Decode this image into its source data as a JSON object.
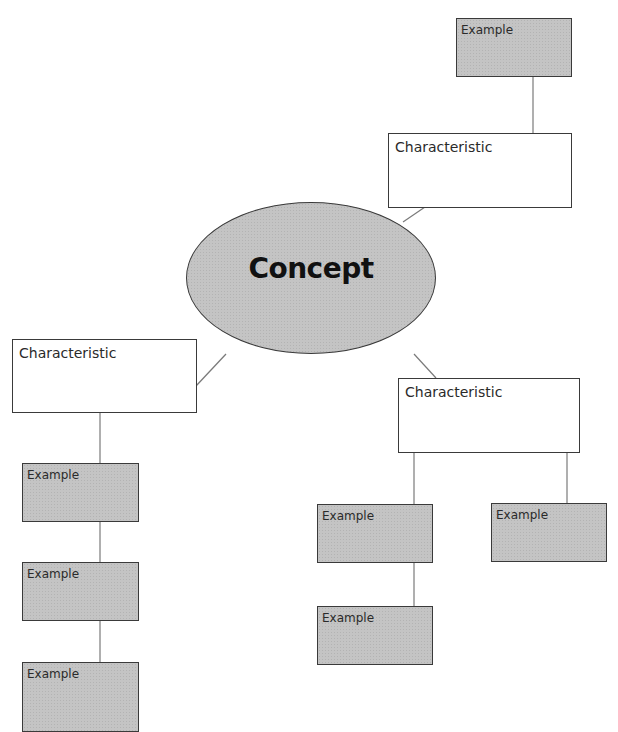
{
  "diagram": {
    "type": "concept-map",
    "center": {
      "label": "Concept"
    },
    "characteristics": [
      {
        "label": "Characteristic",
        "examples": [
          "Example"
        ]
      },
      {
        "label": "Characteristic",
        "examples": [
          "Example",
          "Example",
          "Example"
        ]
      },
      {
        "label": "Characteristic",
        "examples": [
          "Example",
          "Example",
          "Example"
        ]
      }
    ]
  },
  "colors": {
    "node_fill": "#c4c4c4",
    "border": "#3a3a3a",
    "line": "#7a7a7a",
    "background": "#ffffff"
  }
}
